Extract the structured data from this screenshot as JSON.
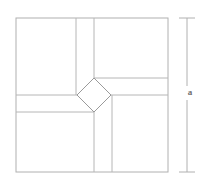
{
  "figure": {
    "background_color": "#ffffff",
    "stroke_color": "#b0b0b0",
    "stroke_color_dark": "#9a9a9a",
    "stroke_width": 1,
    "canvas": {
      "width": 207,
      "height": 185
    }
  },
  "outer_square": {
    "name": "outer-square",
    "x": 16,
    "y": 18,
    "width": 152,
    "height": 154,
    "side_label": "a"
  },
  "center_diamond": {
    "name": "center-rotated-square",
    "vertices": {
      "top": [
        94,
        78
      ],
      "left": [
        77,
        95
      ],
      "bottom": [
        94,
        112
      ],
      "right": [
        111,
        95
      ]
    }
  },
  "internal_lines": [
    {
      "name": "top-vertical-left",
      "x1": 76,
      "y1": 18,
      "x2": 76,
      "y2": 95
    },
    {
      "name": "top-vertical-right",
      "x1": 94,
      "y1": 18,
      "x2": 94,
      "y2": 78
    },
    {
      "name": "left-horizontal-upper",
      "x1": 16,
      "y1": 95,
      "x2": 77,
      "y2": 95
    },
    {
      "name": "left-horizontal-lower",
      "x1": 16,
      "y1": 112,
      "x2": 94,
      "y2": 112
    },
    {
      "name": "right-horizontal-upper",
      "x1": 94,
      "y1": 78,
      "x2": 168,
      "y2": 78
    },
    {
      "name": "right-horizontal-lower",
      "x1": 111,
      "y1": 95,
      "x2": 168,
      "y2": 95
    },
    {
      "name": "bottom-vertical-left",
      "x1": 94,
      "y1": 112,
      "x2": 94,
      "y2": 172
    },
    {
      "name": "bottom-vertical-right",
      "x1": 112,
      "y1": 95,
      "x2": 112,
      "y2": 172
    }
  ],
  "dimension": {
    "name": "side-length-dimension",
    "label": "a",
    "axis_x": 187,
    "y_top": 18,
    "y_bottom": 172,
    "cap_half_width": 8,
    "label_x": 190,
    "label_y": 93
  }
}
